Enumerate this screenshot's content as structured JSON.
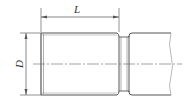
{
  "diagram": {
    "type": "technical-drawing",
    "dimensions": {
      "length_label": "L",
      "diameter_label": "D"
    },
    "colors": {
      "line": "#555555",
      "background": "#ffffff"
    }
  }
}
